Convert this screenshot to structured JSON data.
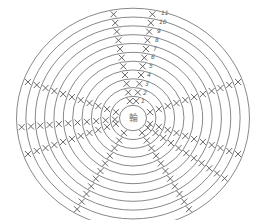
{
  "diagram": {
    "type": "crochet-chart",
    "center_label": "輪",
    "row_labels": [
      "1",
      "2",
      "3",
      "4",
      "5",
      "6",
      "7",
      "8",
      "9",
      "10",
      "11"
    ],
    "center": [
      133,
      118
    ],
    "ring_radii": [
      13,
      22,
      31,
      40,
      49,
      58,
      67,
      76,
      85,
      94,
      103,
      112
    ],
    "colors": {
      "line": "#7a7a7a",
      "stitch": "#555555"
    }
  }
}
